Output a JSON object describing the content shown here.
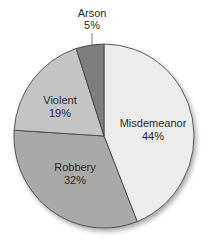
{
  "chart_data": {
    "type": "pie",
    "title": "",
    "start_angle_deg": 0,
    "direction": "clockwise",
    "slices": [
      {
        "label": "Misdemeanor",
        "value": 44,
        "display": "44%",
        "color": "#ececec"
      },
      {
        "label": "Robbery",
        "value": 32,
        "display": "32%",
        "color": "#a9a9a9"
      },
      {
        "label": "Violent",
        "value": 19,
        "display": "19%",
        "color": "#c4c4c4"
      },
      {
        "label": "Arson",
        "value": 5,
        "display": "5%",
        "color": "#7e7e7e"
      }
    ],
    "legend": "none (labels inside / above slices)"
  },
  "labels": {
    "misdemeanor": {
      "name": "Misdemeanor",
      "pct": "44%"
    },
    "robbery": {
      "name": "Robbery",
      "pct": "32%"
    },
    "violent": {
      "name": "Violent",
      "pct": "19%"
    },
    "arson": {
      "name": "Arson",
      "pct": "5%"
    }
  }
}
